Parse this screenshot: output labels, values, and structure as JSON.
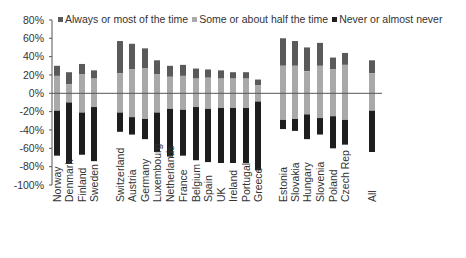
{
  "chart_data": {
    "type": "bar",
    "stacked": true,
    "diverging": true,
    "title": "",
    "xlabel": "",
    "ylabel": "",
    "ylim": [
      -100,
      80
    ],
    "yticks": [
      "80%",
      "60%",
      "40%",
      "20%",
      "0%",
      "-20%",
      "-40%",
      "-60%",
      "-80%",
      "-100%"
    ],
    "legend_position": "top",
    "grid": false,
    "colors": {
      "always": "#5a5a5a",
      "some": "#a9a9a9",
      "never": "#1e1e1e"
    },
    "legend": [
      {
        "key": "always",
        "label": "Always or most of the time"
      },
      {
        "key": "some",
        "label": "Some or about half the time"
      },
      {
        "key": "never",
        "label": "Never or almost never"
      }
    ],
    "groups": [
      [
        "Norway",
        "Denmark",
        "Finland",
        "Sweden"
      ],
      [
        "Switzerland",
        "Austria",
        "Germany",
        "Luxembourg",
        "Netherlands",
        "France",
        "Belgium",
        "Spain",
        "UK",
        "Ireland",
        "Portugal",
        "Greece"
      ],
      [
        "Estonia",
        "Slovakia",
        "Hungary",
        "Slovenia",
        "Poland",
        "Czech Rep"
      ],
      [
        "All"
      ]
    ],
    "categories": [
      "Norway",
      "Denmark",
      "Finland",
      "Sweden",
      "Switzerland",
      "Austria",
      "Germany",
      "Luxembourg",
      "Netherlands",
      "France",
      "Belgium",
      "Spain",
      "UK",
      "Ireland",
      "Portugal",
      "Greece",
      "Estonia",
      "Slovakia",
      "Hungary",
      "Slovenia",
      "Poland",
      "Czech Rep",
      "All"
    ],
    "x_positions": [
      57,
      69,
      82,
      94,
      120,
      132,
      145,
      157,
      170,
      183,
      196,
      208,
      221,
      233,
      246,
      258,
      283,
      295,
      307,
      320,
      333,
      345,
      372
    ],
    "bars": [
      {
        "country": "Norway",
        "top": 30,
        "always_from": 19,
        "some_from": -19,
        "bottom": -68
      },
      {
        "country": "Denmark",
        "top": 23,
        "always_from": 10,
        "some_from": -10,
        "bottom": -77
      },
      {
        "country": "Finland",
        "top": 32,
        "always_from": 21,
        "some_from": -21,
        "bottom": -67
      },
      {
        "country": "Sweden",
        "top": 25,
        "always_from": 16,
        "some_from": -15,
        "bottom": -74
      },
      {
        "country": "Switzerland",
        "top": 57,
        "always_from": 22,
        "some_from": -21,
        "bottom": -42
      },
      {
        "country": "Austria",
        "top": 54,
        "always_from": 26,
        "some_from": -26,
        "bottom": -45
      },
      {
        "country": "Germany",
        "top": 49,
        "always_from": 27,
        "some_from": -28,
        "bottom": -50
      },
      {
        "country": "Luxembourg",
        "top": 36,
        "always_from": 21,
        "some_from": -21,
        "bottom": -64
      },
      {
        "country": "Netherlands",
        "top": 30,
        "always_from": 18,
        "some_from": -17,
        "bottom": -69
      },
      {
        "country": "France",
        "top": 31,
        "always_from": 19,
        "some_from": -18,
        "bottom": -68
      },
      {
        "country": "Belgium",
        "top": 27,
        "always_from": 16,
        "some_from": -15,
        "bottom": -73
      },
      {
        "country": "Spain",
        "top": 26,
        "always_from": 17,
        "some_from": -17,
        "bottom": -75
      },
      {
        "country": "UK",
        "top": 25,
        "always_from": 16,
        "some_from": -16,
        "bottom": -76
      },
      {
        "country": "Ireland",
        "top": 23,
        "always_from": 16,
        "some_from": -16,
        "bottom": -76
      },
      {
        "country": "Portugal",
        "top": 23,
        "always_from": 16,
        "some_from": -16,
        "bottom": -76
      },
      {
        "country": "Greece",
        "top": 15,
        "always_from": 9,
        "some_from": -9,
        "bottom": -84
      },
      {
        "country": "Estonia",
        "top": 60,
        "always_from": 30,
        "some_from": -29,
        "bottom": -39
      },
      {
        "country": "Slovakia",
        "top": 57,
        "always_from": 30,
        "some_from": -28,
        "bottom": -41
      },
      {
        "country": "Hungary",
        "top": 50,
        "always_from": 24,
        "some_from": -23,
        "bottom": -50
      },
      {
        "country": "Slovenia",
        "top": 55,
        "always_from": 30,
        "some_from": -27,
        "bottom": -45
      },
      {
        "country": "Poland",
        "top": 39,
        "always_from": 26,
        "some_from": -25,
        "bottom": -60
      },
      {
        "country": "Czech Rep",
        "top": 44,
        "always_from": 31,
        "some_from": -29,
        "bottom": -56
      },
      {
        "country": "All",
        "top": 36,
        "always_from": 22,
        "some_from": -19,
        "bottom": -64
      }
    ],
    "series": [
      {
        "name": "Always or most of the time",
        "values": [
          11,
          13,
          11,
          9,
          35,
          28,
          22,
          15,
          12,
          12,
          11,
          9,
          9,
          7,
          7,
          6,
          30,
          27,
          26,
          25,
          13,
          13,
          14
        ]
      },
      {
        "name": "Some or about half the time",
        "values": [
          38,
          20,
          42,
          31,
          43,
          52,
          55,
          42,
          35,
          37,
          31,
          34,
          32,
          32,
          32,
          18,
          59,
          58,
          47,
          57,
          51,
          60,
          41
        ]
      },
      {
        "name": "Never or almost never",
        "values": [
          49,
          67,
          46,
          59,
          21,
          19,
          22,
          43,
          52,
          50,
          58,
          58,
          60,
          60,
          60,
          75,
          10,
          13,
          27,
          18,
          35,
          27,
          45
        ]
      }
    ]
  },
  "legend": {
    "items": [
      {
        "label": "Always or most of the time"
      },
      {
        "label": "Some or about half the time"
      },
      {
        "label": "Never or almost never"
      }
    ]
  },
  "yaxis": {
    "ticks": [
      "80%",
      "60%",
      "40%",
      "20%",
      "0%",
      "-20%",
      "-40%",
      "-60%",
      "-80%",
      "-100%"
    ]
  }
}
